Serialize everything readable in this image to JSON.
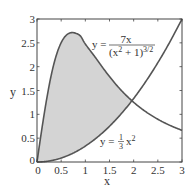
{
  "chart_data": {
    "type": "area",
    "title": "",
    "xlabel": "x",
    "ylabel": "y",
    "xlim": [
      0,
      3
    ],
    "ylim": [
      0,
      3
    ],
    "grid": false,
    "xticks": [
      0,
      0.5,
      1,
      1.5,
      2,
      2.5,
      3
    ],
    "xtick_labels": [
      "0",
      "0.5",
      "1",
      "1.5",
      "2",
      "2.5",
      "3"
    ],
    "yticks": [
      0,
      0.5,
      1,
      1.5,
      2,
      2.5,
      3
    ],
    "ytick_labels": [
      "0",
      "0.5",
      "1",
      "1.5",
      "2",
      "2.5",
      "3"
    ],
    "x": [
      0,
      0.1,
      0.2,
      0.3,
      0.4,
      0.5,
      0.6,
      0.7,
      0.8,
      0.9,
      1.0,
      1.2,
      1.4,
      1.6,
      1.8,
      2.0,
      2.2,
      2.4,
      2.6,
      2.8,
      3.0
    ],
    "series": [
      {
        "name": "y = 7x / (x^2 + 1)^(3/2)",
        "values": [
          0,
          0.69,
          1.32,
          1.847,
          2.241,
          2.504,
          2.654,
          2.712,
          2.701,
          2.641,
          2.475,
          2.204,
          1.924,
          1.667,
          1.443,
          1.252,
          1.091,
          0.956,
          0.842,
          0.746,
          0.664
        ]
      },
      {
        "name": "y = (1/3) x^2",
        "values": [
          0,
          0.003,
          0.013,
          0.03,
          0.053,
          0.083,
          0.12,
          0.163,
          0.213,
          0.27,
          0.333,
          0.48,
          0.653,
          0.853,
          1.08,
          1.333,
          1.613,
          1.92,
          2.253,
          2.613,
          3.0
        ]
      }
    ],
    "shaded_region": {
      "between": [
        "y = 7x / (x^2 + 1)^(3/2)",
        "y = (1/3) x^2"
      ],
      "x_from": 0,
      "x_to": 1.97,
      "color": "#d4d4d4"
    },
    "annotations": [
      {
        "text": "y = 7x / (x² + 1)^{3/2}",
        "x": 1.65,
        "y": 2.55
      },
      {
        "text": "y = ⅓x²",
        "x": 1.35,
        "y": 0.45
      }
    ],
    "intersection": {
      "x": 1.97,
      "y": 1.29
    }
  },
  "labels": {
    "xlabel": "x",
    "ylabel": "y",
    "eq1_lhs": "y =",
    "eq1_num": "7x",
    "eq1_den": "(x",
    "eq1_den_sup": "2",
    "eq1_den_rest": " + 1)",
    "eq1_den_exp": "3/2",
    "eq2_lhs": "y =",
    "eq2_frac_num": "1",
    "eq2_frac_den": "3",
    "eq2_x": "x",
    "eq2_sup": "2"
  },
  "colors": {
    "curve": "#555555",
    "fill": "#d4d4d4",
    "axis": "#444444"
  }
}
